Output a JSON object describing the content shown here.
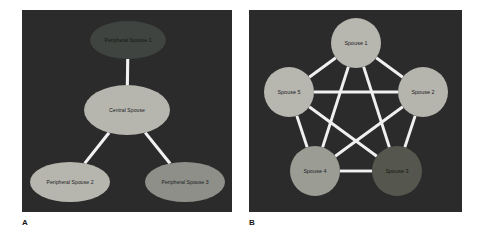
{
  "figure": {
    "background": "#ffffff",
    "panel_background": "#2b2b2b",
    "edge_color": "#f2f2f2",
    "width": 481,
    "height": 241
  },
  "panels": [
    {
      "letter": "A",
      "layout": "star",
      "node_fill": "#b5b5ad",
      "nodes": [
        {
          "id": "central",
          "label": "Central Spouse",
          "cx": 105,
          "cy": 100,
          "rx": 43,
          "ry": 25,
          "fill": "#b6b6ae"
        },
        {
          "id": "periph1",
          "label": "Peripheral Spouse 1",
          "cx": 106,
          "cy": 30,
          "rx": 38,
          "ry": 19,
          "fill": "#3f4440"
        },
        {
          "id": "periph2",
          "label": "Peripheral Spouse 2",
          "cx": 48,
          "cy": 172,
          "rx": 40,
          "ry": 20,
          "fill": "#b6b6ae"
        },
        {
          "id": "periph3",
          "label": "Peripheral Spouse 3",
          "cx": 163,
          "cy": 172,
          "rx": 40,
          "ry": 20,
          "fill": "#8d8f88"
        }
      ],
      "edges": [
        {
          "from": "central",
          "to": "periph1"
        },
        {
          "from": "central",
          "to": "periph2"
        },
        {
          "from": "central",
          "to": "periph3"
        }
      ]
    },
    {
      "letter": "B",
      "layout": "complete-graph",
      "node_fill": "#b6b6ae",
      "nodes": [
        {
          "id": "s1",
          "label": "Spouse 1",
          "cx": 107,
          "cy": 33,
          "r": 25,
          "fill": "#b7b7af"
        },
        {
          "id": "s2",
          "label": "Spouse 2",
          "cx": 174,
          "cy": 82,
          "r": 25,
          "fill": "#b5b5ad"
        },
        {
          "id": "s3",
          "label": "Spouse 3",
          "cx": 148,
          "cy": 161,
          "r": 25,
          "fill": "#55574e"
        },
        {
          "id": "s4",
          "label": "Spouse 4",
          "cx": 66,
          "cy": 161,
          "r": 25,
          "fill": "#9b9d95"
        },
        {
          "id": "s5",
          "label": "Spouse 5",
          "cx": 40,
          "cy": 82,
          "r": 25,
          "fill": "#b7b7af"
        }
      ],
      "edges": [
        {
          "from": "s1",
          "to": "s2"
        },
        {
          "from": "s1",
          "to": "s3"
        },
        {
          "from": "s1",
          "to": "s4"
        },
        {
          "from": "s1",
          "to": "s5"
        },
        {
          "from": "s2",
          "to": "s3"
        },
        {
          "from": "s2",
          "to": "s4"
        },
        {
          "from": "s2",
          "to": "s5"
        },
        {
          "from": "s3",
          "to": "s4"
        },
        {
          "from": "s3",
          "to": "s5"
        },
        {
          "from": "s4",
          "to": "s5"
        }
      ]
    }
  ]
}
